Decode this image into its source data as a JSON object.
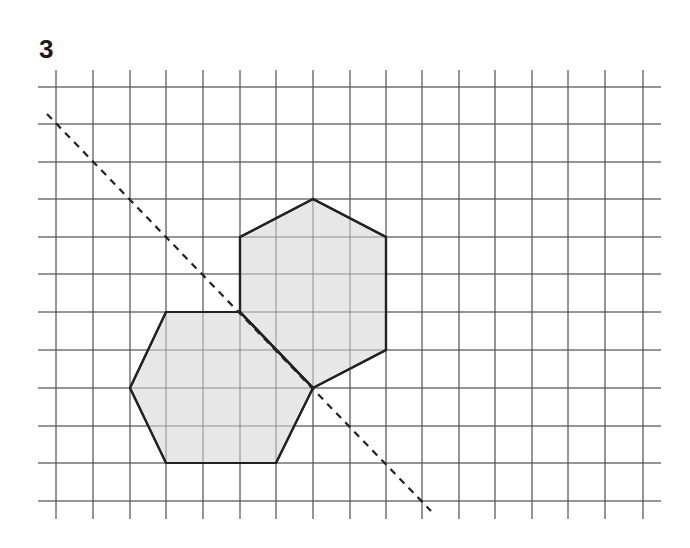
{
  "exercise": {
    "number": "3"
  },
  "grid": {
    "vertical_x": [
      56,
      93,
      130,
      166,
      203,
      240,
      276,
      313,
      350,
      386,
      422,
      459,
      495,
      532,
      568,
      605,
      643
    ],
    "horizontal_y": [
      87,
      124,
      162,
      199,
      237,
      274,
      312,
      350,
      388,
      426,
      463,
      501
    ],
    "x_extent": [
      38,
      661
    ],
    "y_extent": [
      70,
      519
    ],
    "line_color": "#555555"
  },
  "shapes": [
    {
      "name": "upper-hexagon",
      "points": [
        [
          313,
          199
        ],
        [
          386,
          237
        ],
        [
          386,
          350
        ],
        [
          313,
          388
        ],
        [
          240,
          312
        ],
        [
          240,
          237
        ]
      ],
      "fill": "#e3e3e3",
      "stroke": "#222222"
    },
    {
      "name": "lower-hexagon",
      "points": [
        [
          166,
          312
        ],
        [
          240,
          312
        ],
        [
          313,
          388
        ],
        [
          276,
          463
        ],
        [
          166,
          463
        ],
        [
          130,
          388
        ]
      ],
      "fill": "#e3e3e3",
      "stroke": "#222222"
    }
  ],
  "mirror_line": {
    "from": [
      47,
      114
    ],
    "to": [
      431,
      511
    ],
    "style": "dashed",
    "color": "#222222"
  }
}
